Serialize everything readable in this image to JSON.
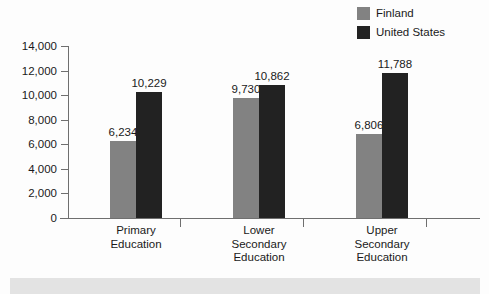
{
  "chart_data": {
    "type": "bar",
    "title": "",
    "xlabel": "",
    "ylabel": "",
    "ylim": [
      0,
      14000
    ],
    "ytick_step": 2000,
    "grid": false,
    "legend_position": "top-right",
    "categories": [
      "Primary\nEducation",
      "Lower\nSecondary\nEducation",
      "Upper\nSecondary\nEducation"
    ],
    "category_lines": [
      [
        "Primary",
        "Education"
      ],
      [
        "Lower",
        "Secondary",
        "Education"
      ],
      [
        "Upper",
        "Secondary",
        "Education"
      ]
    ],
    "ytick_labels": [
      "14,000",
      "12,000",
      "10,000",
      "8,000",
      "6,000",
      "4,000",
      "2,000",
      "0"
    ],
    "ytick_values": [
      14000,
      12000,
      10000,
      8000,
      6000,
      4000,
      2000,
      0
    ],
    "series": [
      {
        "name": "Finland",
        "color": "#828282",
        "values": [
          6234,
          9730,
          6806
        ],
        "labels": [
          "6,234",
          "9,730",
          "6,806"
        ]
      },
      {
        "name": "United States",
        "color": "#222222",
        "values": [
          10229,
          10862,
          11788
        ],
        "labels": [
          "10,229",
          "10,862",
          "11,788"
        ]
      }
    ]
  },
  "legend": {
    "items": [
      {
        "label": "Finland",
        "color": "#828282"
      },
      {
        "label": "United States",
        "color": "#222222"
      }
    ]
  },
  "footer": {
    "band_text": ""
  }
}
